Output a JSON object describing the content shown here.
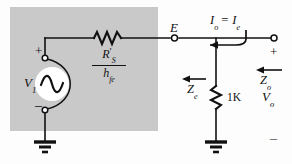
{
  "figure": {
    "type": "circuit-schematic",
    "shaded_region_color": "#c9c9c9",
    "wire_color": "#111111",
    "background_color": "#fdfdfd"
  },
  "labels": {
    "source": {
      "symbol": "V",
      "subscript": "1",
      "text": "V1"
    },
    "source_plus": "+",
    "source_minus": "–",
    "series_resistor_numerator": "R",
    "series_resistor_numerator_prime": "′",
    "series_resistor_numerator_sub": "S",
    "series_resistor_denominator": "h",
    "series_resistor_denominator_sub": "fe",
    "node_e": "E",
    "output_current": "I",
    "output_current_sub": "o",
    "output_current_equals": "=",
    "emitter_current": "I",
    "emitter_current_sub": "e",
    "impedance_e": "Z",
    "impedance_e_sub": "e",
    "impedance_o": "Z",
    "impedance_o_sub": "o",
    "load_resistor": "1K",
    "output_voltage": "V",
    "output_voltage_sub": "o",
    "output_plus": "+",
    "output_minus": "–"
  },
  "components": [
    {
      "name": "ac-voltage-source",
      "label": "V1"
    },
    {
      "name": "series-resistor",
      "label": "R'S / hfe"
    },
    {
      "name": "load-resistor",
      "label": "1K"
    },
    {
      "name": "ground-left",
      "label": ""
    },
    {
      "name": "ground-right",
      "label": ""
    },
    {
      "name": "terminal-node-e",
      "label": "E"
    },
    {
      "name": "terminal-output-positive",
      "label": "+"
    }
  ],
  "annotations": [
    {
      "name": "current-arrow-output",
      "label": "Io = Ie",
      "direction": "left"
    },
    {
      "name": "impedance-arrow-ze",
      "label": "Ze",
      "direction": "left"
    },
    {
      "name": "impedance-arrow-zo",
      "label": "Zo",
      "direction": "left"
    }
  ]
}
